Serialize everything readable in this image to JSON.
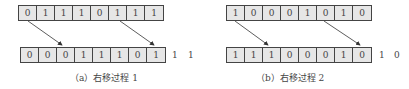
{
  "panels": [
    {
      "id": "a",
      "top_bits": [
        "0",
        "1",
        "1",
        "1",
        "0",
        "1",
        "1",
        "1"
      ],
      "bottom_bits": [
        "0",
        "0",
        "0",
        "1",
        "1",
        "1",
        "0",
        "1"
      ],
      "overflow_bits": [
        "1",
        "1"
      ],
      "caption": "（a）右移过程 1"
    },
    {
      "id": "b",
      "top_bits": [
        "1",
        "0",
        "0",
        "0",
        "1",
        "0",
        "1",
        "0"
      ],
      "bottom_bits": [
        "1",
        "1",
        "1",
        "0",
        "0",
        "0",
        "1",
        "0"
      ],
      "overflow_bits": [
        "1",
        "0"
      ],
      "caption": "（b）右移过程 2"
    }
  ],
  "colors": {
    "cell_fill": "#e6e6e6",
    "border": "#444444",
    "arrow": "#333333"
  }
}
